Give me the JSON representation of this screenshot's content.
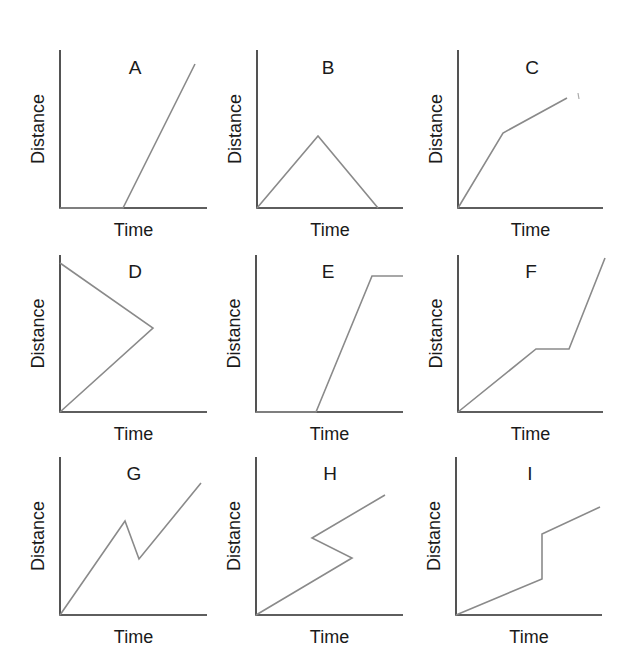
{
  "figure": {
    "x_axis_label": "Time",
    "y_axis_label": "Distance",
    "colors": {
      "axis": "#2a2a2a",
      "curve": "#8a8a8a",
      "text": "#1a1a1a"
    }
  },
  "panels": [
    {
      "label": "A",
      "origin": [
        60,
        208
      ],
      "y_top": 50,
      "x_end": 207,
      "label_pos": [
        135,
        74
      ],
      "points": [
        [
          60,
          208
        ],
        [
          123,
          208
        ],
        [
          195,
          64
        ]
      ]
    },
    {
      "label": "B",
      "origin": [
        257,
        208
      ],
      "y_top": 50,
      "x_end": 403,
      "label_pos": [
        328,
        74
      ],
      "points": [
        [
          257,
          208
        ],
        [
          318,
          136
        ],
        [
          378,
          208
        ]
      ]
    },
    {
      "label": "C",
      "origin": [
        458,
        208
      ],
      "y_top": 50,
      "x_end": 603,
      "label_pos": [
        532,
        74
      ],
      "points": [
        [
          458,
          208
        ],
        [
          503,
          133
        ],
        [
          567,
          98
        ]
      ]
    },
    {
      "label": "D",
      "origin": [
        60,
        412
      ],
      "y_top": 255,
      "x_end": 207,
      "label_pos": [
        135,
        278
      ],
      "points": [
        [
          60,
          263
        ],
        [
          153,
          328
        ],
        [
          60,
          412
        ]
      ]
    },
    {
      "label": "E",
      "origin": [
        256,
        412
      ],
      "y_top": 255,
      "x_end": 403,
      "label_pos": [
        328,
        278
      ],
      "points": [
        [
          256,
          412
        ],
        [
          316,
          412
        ],
        [
          372,
          276
        ],
        [
          403,
          276
        ]
      ]
    },
    {
      "label": "F",
      "origin": [
        458,
        412
      ],
      "y_top": 255,
      "x_end": 603,
      "label_pos": [
        531,
        278
      ],
      "points": [
        [
          458,
          412
        ],
        [
          536,
          349
        ],
        [
          569,
          349
        ],
        [
          605,
          258
        ]
      ]
    },
    {
      "label": "G",
      "origin": [
        60,
        615
      ],
      "y_top": 457,
      "x_end": 207,
      "label_pos": [
        134,
        480
      ],
      "points": [
        [
          60,
          615
        ],
        [
          125,
          521
        ],
        [
          139,
          559
        ],
        [
          201,
          483
        ]
      ]
    },
    {
      "label": "H",
      "origin": [
        256,
        615
      ],
      "y_top": 457,
      "x_end": 403,
      "label_pos": [
        330,
        480
      ],
      "points": [
        [
          256,
          615
        ],
        [
          352,
          558
        ],
        [
          312,
          538
        ],
        [
          385,
          495
        ]
      ]
    },
    {
      "label": "I",
      "origin": [
        456,
        615
      ],
      "y_top": 457,
      "x_end": 602,
      "label_pos": [
        530,
        480
      ],
      "points": [
        [
          456,
          615
        ],
        [
          542,
          579
        ],
        [
          542,
          534
        ],
        [
          600,
          507
        ]
      ]
    }
  ]
}
